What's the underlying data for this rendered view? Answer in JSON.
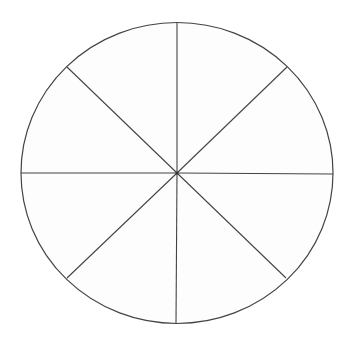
{
  "diagram": {
    "type": "segmented-circle",
    "segments": 8,
    "fill": "#fdfdfd",
    "stroke": "#444444",
    "center": [
      177,
      173
    ],
    "rx": 156,
    "ry": 150.5,
    "spoke_ends": [
      [
        177,
        22
      ],
      [
        287,
        67
      ],
      [
        333,
        174
      ],
      [
        286,
        278
      ],
      [
        176,
        323
      ],
      [
        67,
        278
      ],
      [
        21,
        173
      ],
      [
        67,
        67
      ]
    ]
  }
}
